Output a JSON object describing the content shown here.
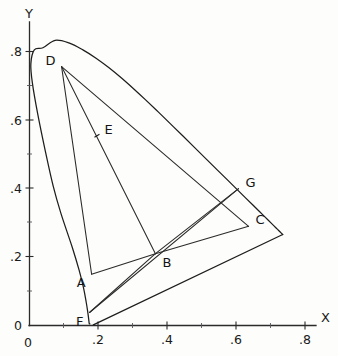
{
  "figure": {
    "background_color": "#fdfdfb",
    "line_color": "#1d1d1d"
  },
  "axes": {
    "x_axis_name": "X",
    "y_axis_name": "Y",
    "origin_label": "0",
    "x_ticks": [
      {
        "label": "0",
        "value": 0.0
      },
      {
        "label": ".2",
        "value": 0.2
      },
      {
        "label": ".4",
        "value": 0.4
      },
      {
        "label": ".6",
        "value": 0.6
      },
      {
        "label": ".8",
        "value": 0.8
      }
    ],
    "y_ticks": [
      {
        "label": "0",
        "value": 0.0
      },
      {
        "label": ".2",
        "value": 0.2
      },
      {
        "label": ".4",
        "value": 0.4
      },
      {
        "label": ".6",
        "value": 0.6
      },
      {
        "label": ".8",
        "value": 0.8
      }
    ]
  },
  "chart_data": {
    "type": "scatter",
    "title": "",
    "xlabel": "X",
    "ylabel": "Y",
    "xlim": [
      0,
      0.85
    ],
    "ylim": [
      0,
      0.9
    ],
    "grid": false,
    "legend": "none",
    "points": [
      {
        "name": "A",
        "label": "A",
        "x": 0.18,
        "y": 0.15,
        "label_side": "left"
      },
      {
        "name": "B",
        "label": "B",
        "x": 0.365,
        "y": 0.21,
        "label_side": "right"
      },
      {
        "name": "C",
        "label": "C",
        "x": 0.635,
        "y": 0.29,
        "label_side": "right"
      },
      {
        "name": "D",
        "label": "D",
        "x": 0.093,
        "y": 0.757,
        "label_side": "left"
      },
      {
        "name": "E",
        "label": "E",
        "x": 0.197,
        "y": 0.555,
        "label_side": "right"
      },
      {
        "name": "F",
        "label": "F",
        "x": 0.174,
        "y": 0.038,
        "label_side": "left"
      },
      {
        "name": "G",
        "label": "G",
        "x": 0.606,
        "y": 0.4,
        "label_side": "right"
      }
    ],
    "segments": [
      {
        "name": "D-A",
        "from": "D",
        "to": "A"
      },
      {
        "name": "A-B",
        "from": "A",
        "to": "B"
      },
      {
        "name": "D-B",
        "from": "D",
        "to": "B"
      },
      {
        "name": "D-C",
        "from": "D",
        "to": "C"
      },
      {
        "name": "B-C",
        "from": "B",
        "to": "C"
      },
      {
        "name": "B-G",
        "from": "B",
        "to": "G"
      },
      {
        "name": "F-B",
        "from": "F",
        "to": "B"
      },
      {
        "name": "F-G",
        "from": "F",
        "to": "G"
      }
    ],
    "spectral_locus": {
      "name": "spectral-locus",
      "description": "horseshoe-shaped outer boundary of visible colors",
      "points": [
        [
          0.175,
          0.005
        ],
        [
          0.1738,
          0.0049
        ],
        [
          0.1733,
          0.0048
        ],
        [
          0.1726,
          0.0093
        ],
        [
          0.1714,
          0.0203
        ],
        [
          0.1689,
          0.039
        ],
        [
          0.1644,
          0.068
        ],
        [
          0.1566,
          0.1098
        ],
        [
          0.144,
          0.1611
        ],
        [
          0.1241,
          0.2282
        ],
        [
          0.0913,
          0.327
        ],
        [
          0.0687,
          0.4073
        ],
        [
          0.0454,
          0.5121
        ],
        [
          0.0235,
          0.62
        ],
        [
          0.0082,
          0.71
        ],
        [
          0.0039,
          0.765
        ],
        [
          0.0139,
          0.806
        ],
        [
          0.0389,
          0.812
        ],
        [
          0.0743,
          0.8338
        ],
        [
          0.1142,
          0.8262
        ],
        [
          0.1547,
          0.8059
        ],
        [
          0.1929,
          0.7816
        ],
        [
          0.2296,
          0.7543
        ],
        [
          0.2658,
          0.7243
        ],
        [
          0.3016,
          0.6923
        ],
        [
          0.3373,
          0.6589
        ],
        [
          0.3731,
          0.6245
        ],
        [
          0.4087,
          0.5896
        ],
        [
          0.4441,
          0.5547
        ],
        [
          0.4788,
          0.5202
        ],
        [
          0.5125,
          0.4866
        ],
        [
          0.5448,
          0.4544
        ],
        [
          0.5752,
          0.4242
        ],
        [
          0.6029,
          0.3965
        ],
        [
          0.627,
          0.3725
        ],
        [
          0.6482,
          0.3514
        ],
        [
          0.6658,
          0.334
        ],
        [
          0.6801,
          0.3197
        ],
        [
          0.6915,
          0.3083
        ],
        [
          0.7006,
          0.2993
        ],
        [
          0.7079,
          0.292
        ],
        [
          0.714,
          0.2859
        ],
        [
          0.719,
          0.2809
        ],
        [
          0.723,
          0.277
        ],
        [
          0.726,
          0.274
        ],
        [
          0.734,
          0.266
        ]
      ]
    },
    "purple_line": {
      "name": "purple-line",
      "description": "line of purples closing the horseshoe",
      "from": [
        0.185,
        0.002
      ],
      "to": [
        0.734,
        0.266
      ]
    }
  }
}
